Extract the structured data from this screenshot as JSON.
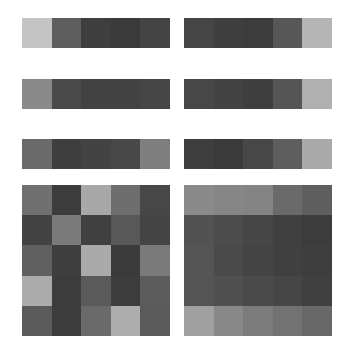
{
  "chart_data": [
    {
      "type": "heatmap",
      "title": "",
      "panel": "strip-row1-left",
      "rows": 1,
      "cols": 5,
      "colors": [
        [
          "#c4c4c4",
          "#5e5e5e",
          "#3e3e3e",
          "#3a3a3a",
          "#444444"
        ]
      ]
    },
    {
      "type": "heatmap",
      "title": "",
      "panel": "strip-row1-right",
      "rows": 1,
      "cols": 5,
      "colors": [
        [
          "#454545",
          "#3f3f3f",
          "#3c3c3c",
          "#575757",
          "#b5b5b5"
        ]
      ]
    },
    {
      "type": "heatmap",
      "title": "",
      "panel": "strip-row2-left",
      "rows": 1,
      "cols": 5,
      "colors": [
        [
          "#8a8a8a",
          "#4a4a4a",
          "#424242",
          "#424242",
          "#464646"
        ]
      ]
    },
    {
      "type": "heatmap",
      "title": "",
      "panel": "strip-row2-right",
      "rows": 1,
      "cols": 5,
      "colors": [
        [
          "#474747",
          "#424242",
          "#3e3e3e",
          "#555555",
          "#b0b0b0"
        ]
      ]
    },
    {
      "type": "heatmap",
      "title": "",
      "panel": "strip-row3-left",
      "rows": 1,
      "cols": 5,
      "colors": [
        [
          "#6a6a6a",
          "#3e3e3e",
          "#434343",
          "#484848",
          "#7e7e7e"
        ]
      ]
    },
    {
      "type": "heatmap",
      "title": "",
      "panel": "strip-row3-right",
      "rows": 1,
      "cols": 5,
      "colors": [
        [
          "#3e3e3e",
          "#3a3a3a",
          "#474747",
          "#5e5e5e",
          "#aaaaaa"
        ]
      ]
    },
    {
      "type": "heatmap",
      "title": "",
      "panel": "grid-left",
      "rows": 5,
      "cols": 5,
      "colors": [
        [
          "#707070",
          "#3c3c3c",
          "#a8a8a8",
          "#6e6e6e",
          "#474747"
        ],
        [
          "#434343",
          "#7a7a7a",
          "#404040",
          "#585858",
          "#444444"
        ],
        [
          "#606060",
          "#3e3e3e",
          "#aaaaaa",
          "#3a3a3a",
          "#7a7a7a"
        ],
        [
          "#ababab",
          "#3c3c3c",
          "#5a5a5a",
          "#3c3c3c",
          "#5c5c5c"
        ],
        [
          "#5a5a5a",
          "#3c3c3c",
          "#6a6a6a",
          "#adadad",
          "#5a5a5a"
        ]
      ]
    },
    {
      "type": "heatmap",
      "title": "",
      "panel": "grid-right",
      "rows": 5,
      "cols": 5,
      "colors": [
        [
          "#8a8a8a",
          "#868686",
          "#848484",
          "#6a6a6a",
          "#5e5e5e"
        ],
        [
          "#525252",
          "#4c4c4c",
          "#464646",
          "#404040",
          "#3c3c3c"
        ],
        [
          "#545454",
          "#4a4a4a",
          "#444444",
          "#404040",
          "#3e3e3e"
        ],
        [
          "#545454",
          "#505050",
          "#4a4a4a",
          "#464646",
          "#404040"
        ],
        [
          "#a0a0a0",
          "#888888",
          "#7c7c7c",
          "#727272",
          "#686868"
        ]
      ]
    }
  ],
  "layout": {
    "panels": [
      {
        "id": "strip-row1-left",
        "x": 22,
        "y": 18,
        "kind": "strip"
      },
      {
        "id": "strip-row1-right",
        "x": 184,
        "y": 18,
        "kind": "strip"
      },
      {
        "id": "strip-row2-left",
        "x": 22,
        "y": 79,
        "kind": "strip"
      },
      {
        "id": "strip-row2-right",
        "x": 184,
        "y": 79,
        "kind": "strip"
      },
      {
        "id": "strip-row3-left",
        "x": 22,
        "y": 139,
        "kind": "strip"
      },
      {
        "id": "strip-row3-right",
        "x": 184,
        "y": 139,
        "kind": "strip"
      },
      {
        "id": "grid-left",
        "x": 22,
        "y": 185,
        "kind": "grid5"
      },
      {
        "id": "grid-right",
        "x": 184,
        "y": 185,
        "kind": "grid5"
      }
    ]
  }
}
